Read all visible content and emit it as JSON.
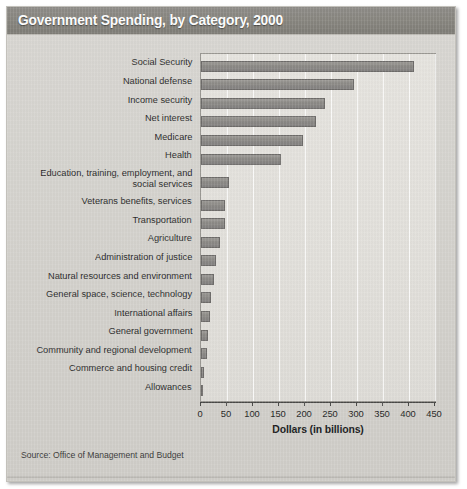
{
  "title": "Government Spending, by Category, 2000",
  "source": "Source: Office of Management and Budget",
  "axis_title": "Dollars (in billions)",
  "colors": {
    "title_band": "#88867f",
    "bar": "#8d8b87",
    "bar_outline": "#6e6c6a",
    "plot_background": "#e2e0db",
    "page_background": "#d4d2cd"
  },
  "ticks": [
    "0",
    "50",
    "100",
    "150",
    "200",
    "250",
    "300",
    "350",
    "400",
    "450"
  ],
  "chart_data": {
    "type": "bar",
    "orientation": "horizontal",
    "title": "Government Spending, by Category, 2000",
    "xlabel": "Dollars (in billions)",
    "ylabel": "",
    "xlim": [
      0,
      450
    ],
    "xticks": [
      0,
      50,
      100,
      150,
      200,
      250,
      300,
      350,
      400,
      450
    ],
    "grid": "vertical",
    "legend": "none",
    "source": "Source: Office of Management and Budget",
    "categories": [
      "Social Security",
      "National defense",
      "Income security",
      "Net interest",
      "Medicare",
      "Health",
      "Education, training, employment, and\nsocial services",
      "Veterans benefits, services",
      "Transportation",
      "Agriculture",
      "Administration of justice",
      "Natural resources and environment",
      "General space,  science, technology",
      "International affairs",
      "General government",
      "Community and regional development",
      "Commerce and housing credit",
      "Allowances"
    ],
    "values": [
      410,
      294,
      238,
      222,
      197,
      154,
      53,
      47,
      46,
      36,
      28,
      25,
      19,
      17,
      13,
      11,
      5,
      1
    ]
  }
}
